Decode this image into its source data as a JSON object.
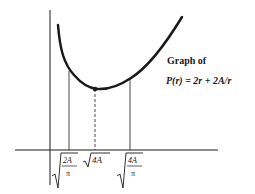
{
  "figure": {
    "title": "Graph of",
    "function": "P(r) = 2r + 2A/r",
    "x_labels": [
      {
        "text": "√(2A/π)",
        "radicand_top": "2A",
        "radicand_bottom": "π"
      },
      {
        "text": "√(4A)",
        "radicand": "4A"
      },
      {
        "text": "√(4A/π)",
        "radicand_top": "4A",
        "radicand_bottom": "π"
      }
    ],
    "minimum_marker": "point at √(4A)",
    "colors": {
      "ink": "#1a1a1a",
      "background": "#ffffff"
    }
  }
}
